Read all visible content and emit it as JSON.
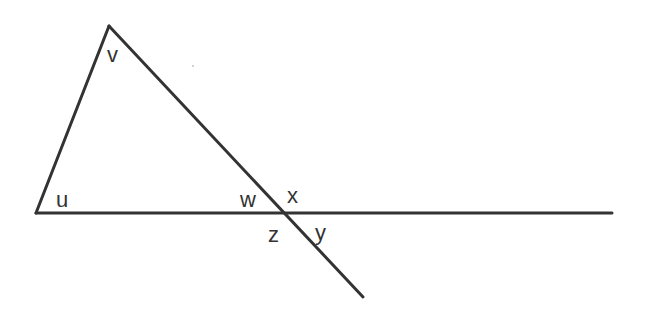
{
  "diagram": {
    "type": "geometry-angles",
    "line_color": "#333333",
    "background": "#ffffff",
    "labels": [
      {
        "id": "u",
        "text": "u",
        "x": 56,
        "y": 207
      },
      {
        "id": "v",
        "text": "v",
        "x": 107,
        "y": 62
      },
      {
        "id": "w",
        "text": "w",
        "x": 240,
        "y": 207
      },
      {
        "id": "x",
        "text": "x",
        "x": 287,
        "y": 203
      },
      {
        "id": "y",
        "text": "y",
        "x": 315,
        "y": 240
      },
      {
        "id": "z",
        "text": "z",
        "x": 268,
        "y": 242
      }
    ]
  }
}
